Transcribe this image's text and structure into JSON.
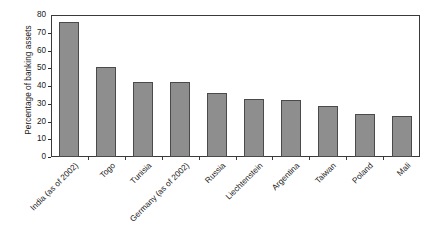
{
  "chart_data": {
    "type": "bar",
    "title": "",
    "subtitle": "",
    "xlabel": "",
    "ylabel": "Percentage of banking assets",
    "ylim": [
      0,
      80
    ],
    "ytick_values": [
      80,
      70,
      60,
      50,
      40,
      30,
      20,
      10,
      0
    ],
    "ytick_labels": [
      "80",
      "70",
      "60",
      "50",
      "40",
      "30",
      "20",
      "10",
      "0"
    ],
    "grid": false,
    "legend": false,
    "legend_position": "none",
    "bar_color": "#8e8e8e",
    "bar_edge_color": "#4a4a4a",
    "axis_color": "#3a3a3a",
    "background": "#ffffff",
    "categories": [
      "India (as of 2002)",
      "Togo",
      "Tunisia",
      "Germany (as of 2002)",
      "Russia",
      "Liechtenstein",
      "Argentina",
      "Taiwan",
      "Poland",
      "Mali"
    ],
    "values": [
      76,
      50.5,
      42,
      42,
      36,
      32.5,
      32,
      29,
      24,
      23
    ]
  },
  "axis": {
    "y_title": "Percentage of banking assets"
  }
}
